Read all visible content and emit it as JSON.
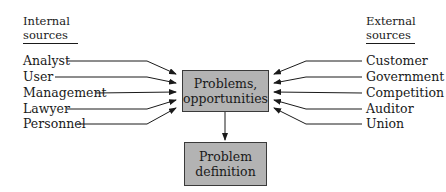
{
  "diagram": {
    "internal": {
      "heading_line1": "Internal",
      "heading_line2": "sources",
      "items": [
        "Analyst",
        "User",
        "Management",
        "Lawyer",
        "Personnel"
      ]
    },
    "external": {
      "heading_line1": "External",
      "heading_line2": "sources",
      "items": [
        "Customer",
        "Government",
        "Competition",
        "Auditor",
        "Union"
      ]
    },
    "center_box": {
      "line1": "Problems,",
      "line2": "opportunities"
    },
    "result_box": {
      "line1": "Problem",
      "line2": "definition"
    },
    "colors": {
      "box_fill": "#b3b3b3",
      "box_border": "#3a3a3a",
      "line": "#1a1a1a"
    }
  }
}
